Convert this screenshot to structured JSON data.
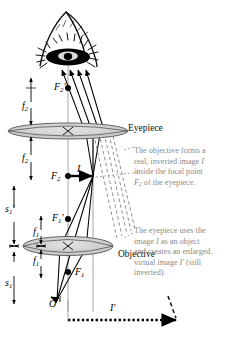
{
  "figure": {
    "type": "optics-ray-diagram",
    "background_color": "#ffffff",
    "ink_color": "#000000",
    "annotation_color": "#8a8a8a",
    "lens_fill_color": "#cfcfcf",
    "lens_stroke_color": "#555555"
  },
  "labels": {
    "eyepiece": "Eyepiece",
    "objective": "Objective",
    "f2_upper": "f2",
    "f2_lower": "f2",
    "f1_upper": "f1",
    "f1_lower": "f1",
    "s1_prime": "s1′",
    "s1": "s1",
    "F2_prime": "F2′",
    "F2": "F2",
    "F1_prime": "F1′",
    "F1": "F1",
    "O": "O",
    "I": "I",
    "I_prime": "I′"
  },
  "annotations": [
    {
      "id": "objective-note",
      "lines": [
        "The objective forms a",
        "real, inverted image I",
        "inside the focal point",
        "F2 of the eyepiece."
      ]
    },
    {
      "id": "eyepiece-note",
      "lines": [
        "The eyepiece uses the",
        "image I as an object",
        "and creates an enlarged,",
        "virtual image I′ (still",
        "inverted)."
      ]
    }
  ],
  "elements": {
    "eye": "observer-eye-illustration",
    "rays_solid": "real-ray-paths",
    "rays_dashed": "virtual-ray-extensions",
    "optic_axis": "vertical-optic-axis",
    "image_arrow_I": "real-inverted-image-arrow",
    "image_arrow_I_prime": "virtual-enlarged-image-arrow-dotted"
  }
}
